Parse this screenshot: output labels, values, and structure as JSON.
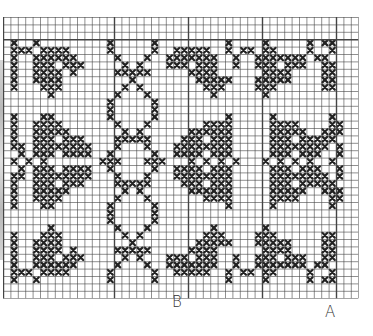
{
  "chart_title": "",
  "grid": {
    "cols": 48,
    "rows": 38,
    "cell_px": 7.4,
    "major_every": 10,
    "major_cols": [
      0,
      15,
      25,
      35,
      45
    ],
    "major_rows": [
      3
    ],
    "line_color": "#444444",
    "stitch_color": "#222222"
  },
  "markers": {
    "b_label": "B",
    "a_label": "A"
  },
  "pattern_rows": [
    "................................................",
    "................................................",
    "................................................",
    ".X..X.........X.....X.........X....X.....X.XX...",
    ".XXX.XXXX.....X.....X..XXXXX..X.XX.XX....X..X...",
    ".X..XXXXXX.....X...X..XXXXXXX..X..XXXXXXX.XX....",
    ".X..XXX.XXX.....X.X...XXX.XXX..X..XXX.XXX..XX...",
    ".X..XXXX.X.....XXXXX.....XXXX......XXXX....XX...",
    ".X..XXXX.........X........XXXXX...XXXXX....XX...",
    ".X...XXX........X.X........XXX....XXX......XX...",
    "......X........X...X........X......X...........",
    "..............X.....X...........................",
    "..............X.....X...........................",
    ".X...XX.......X.....X.........X.....X.......X...",
    ".X..XXXX.......X...X.......XXXX.....XXXX....XX..",
    ".X..XXXXX.......X.X......XXXXXX.....XXXXX..XXX..",
    ".X..XXX.XXX....XXXXX....XXX.XXX.....XXX.XXXXX...",
    ".XX.XXXXXXXX...X...X...XXXXXXXX.....XXXXXXXX.X..",
    "..X.XXX.XXXX..X.....X..XXXX.XXX.....XXX.XXX..X..",
    ".X.X.X.......XXX...XXX...X.X.X.X...X.X.X.X..X...",
    "..X.XXX.XXXX..X.....X..XXXX.XXX.....XXX.XXX..X..",
    ".XX.XXXXXXXX...X...X...XXXXXXXX.....XXXXXXXX.X..",
    ".X..XXX.XXX....XXXXX....XXX.XXX.....XXX.XXXXX...",
    ".X..XXXXX.......X.X......XXXXXX.....XXXXX..XXX..",
    ".X..XXXX.......X...X.......XXXX.....XXXX....XX..",
    ".X...XX.......X.....X.........X.....X.......X...",
    "..............X.....X...........................",
    "..............X.....X...........................",
    "......X........X...X........X......X...........",
    ".X...XXX........X.X........XXX....XXX......XX...",
    ".X..XXXX.........X........XXXXX...XXXXX....XX...",
    ".X..XXXX.X.....XXXXX.....XXXX......XXXX....XX...",
    ".X..XXX.XXX.....X.X...XXX.XXX..X..XXX.XXX..XX...",
    ".X..XXXXXX.....X...X..XXXXXXX..X..XXXXXXX.XX....",
    ".XXX.XXXX.....X.....X..XXXXX..X.XX.XX....X..X...",
    ".X..X.........X.....X.........X....X.....X.XX...",
    "................................................",
    "................................................"
  ]
}
